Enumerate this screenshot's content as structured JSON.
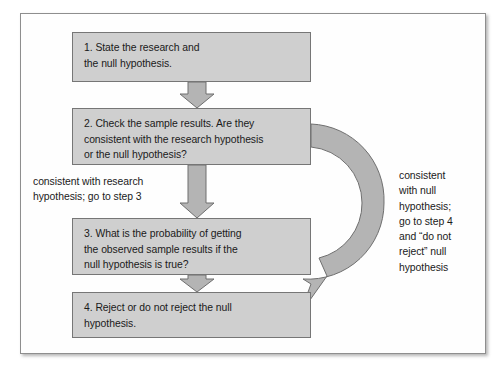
{
  "figure": {
    "type": "flowchart",
    "orientation": "vertical",
    "frame_border_color": "#8e8e8e",
    "box_fill_color": "#cfcfcf",
    "box_border_color": "#767676",
    "arrow_fill_color": "#b4b4b4",
    "arrow_stroke_color": "#6f6f6f",
    "text_color": "#1a1a1a"
  },
  "steps": [
    {
      "id": "step-1",
      "number": "1",
      "text": "1. State the research and\nthe null hypothesis."
    },
    {
      "id": "step-2",
      "number": "2",
      "text": "2. Check the sample results. Are they\nconsistent with the research hypothesis\nor the null hypothesis?"
    },
    {
      "id": "step-3",
      "number": "3",
      "text": "3. What is the probability of getting\nthe observed sample results if the\nnull hypothesis is true?"
    },
    {
      "id": "step-4",
      "number": "4",
      "text": "4. Reject or do not reject the null\nhypothesis."
    }
  ],
  "labels": {
    "left_branch": "consistent with research\nhypothesis; go to step 3",
    "right_branch": "consistent\nwith null\nhypothesis;\ngo to step 4\nand “do not\nreject” null\nhypothesis"
  },
  "connectors": [
    {
      "id": "arrow-1-to-2",
      "from": "step-1",
      "to": "step-2",
      "shape": "down-arrow"
    },
    {
      "id": "arrow-2-to-3",
      "from": "step-2",
      "to": "step-3",
      "shape": "down-arrow"
    },
    {
      "id": "arrow-3-to-4",
      "from": "step-3",
      "to": "step-4",
      "shape": "down-arrow"
    },
    {
      "id": "arrow-2-to-4-curved",
      "from": "step-2",
      "to": "step-4",
      "shape": "curved-arrow-right"
    }
  ]
}
